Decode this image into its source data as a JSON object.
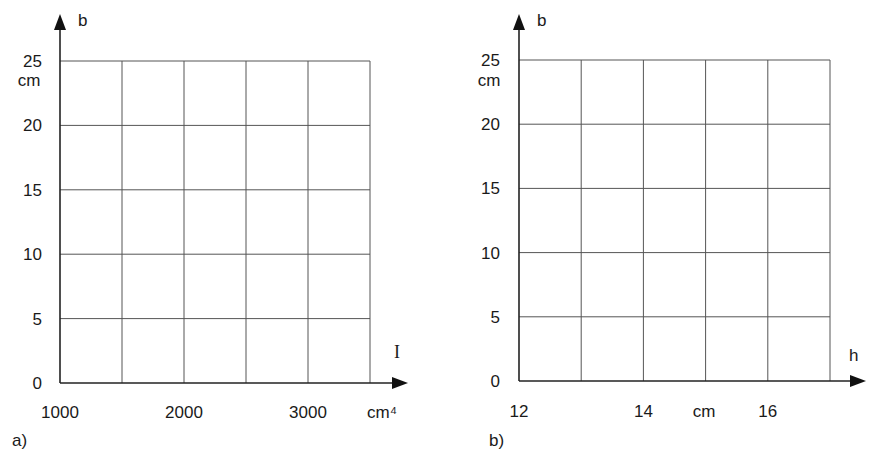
{
  "chart_data": [
    {
      "id": "a",
      "type": "line",
      "panel_label": "a)",
      "title": "",
      "xlabel": "I",
      "xunit": "cm⁴",
      "ylabel": "b",
      "yunit": "cm",
      "xlim": [
        1000,
        3500
      ],
      "ylim": [
        0,
        25
      ],
      "grid": true,
      "x_gridlines": [
        1000,
        1500,
        2000,
        2500,
        3000,
        3500
      ],
      "y_gridlines": [
        0,
        5,
        10,
        15,
        20,
        25
      ],
      "x_tick_labels": [
        {
          "value": 1000,
          "label": "1000"
        },
        {
          "value": 2000,
          "label": "2000"
        },
        {
          "value": 3000,
          "label": "3000"
        }
      ],
      "y_tick_labels": [
        {
          "value": 0,
          "label": "0"
        },
        {
          "value": 5,
          "label": "5"
        },
        {
          "value": 10,
          "label": "10"
        },
        {
          "value": 15,
          "label": "15"
        },
        {
          "value": 20,
          "label": "20"
        },
        {
          "value": 25,
          "label": "25"
        }
      ],
      "series": []
    },
    {
      "id": "b",
      "type": "line",
      "panel_label": "b)",
      "title": "",
      "xlabel": "h",
      "xunit": "cm",
      "ylabel": "b",
      "yunit": "cm",
      "xlim": [
        12,
        17
      ],
      "ylim": [
        0,
        25
      ],
      "grid": true,
      "x_gridlines": [
        12,
        13,
        14,
        15,
        16,
        17
      ],
      "y_gridlines": [
        0,
        5,
        10,
        15,
        20,
        25
      ],
      "x_tick_labels": [
        {
          "value": 12,
          "label": "12"
        },
        {
          "value": 14,
          "label": "14"
        },
        {
          "value": 16,
          "label": "16"
        }
      ],
      "y_tick_labels": [
        {
          "value": 0,
          "label": "0"
        },
        {
          "value": 5,
          "label": "5"
        },
        {
          "value": 10,
          "label": "10"
        },
        {
          "value": 15,
          "label": "15"
        },
        {
          "value": 20,
          "label": "20"
        },
        {
          "value": 25,
          "label": "25"
        }
      ],
      "series": []
    }
  ]
}
